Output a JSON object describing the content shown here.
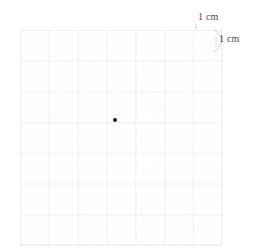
{
  "figure": {
    "background_color": "#ffffff",
    "grid": {
      "major_color": "#e2e2e2",
      "minor_color": "#ededed",
      "major_cells_x": 7,
      "major_cells_y": 7,
      "minor_per_major": 5,
      "cell_size_px": 28.9,
      "left_px": 20,
      "top_px": 30,
      "width_px": 202,
      "height_px": 215
    },
    "point": {
      "label": "marked point",
      "color": "#1a1a1a",
      "diameter_px": 4,
      "x_px": 115,
      "y_px": 120,
      "grid_x_cm": 3.3,
      "grid_y_cm": 3.1
    },
    "annotations": {
      "horizontal_measure": "1 cm",
      "vertical_measure": "1 cm",
      "bracket_color": "#bdbdbd",
      "text_color": "#4a4a4a"
    }
  }
}
